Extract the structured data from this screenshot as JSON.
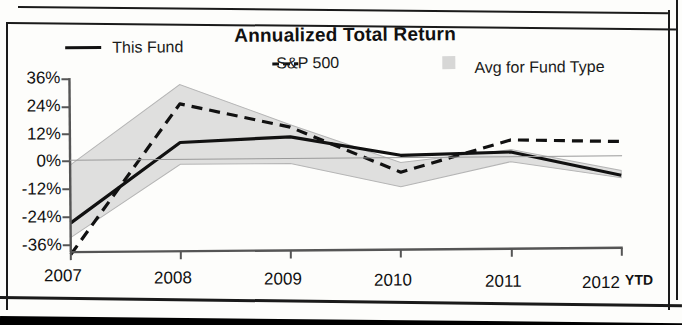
{
  "chart_data": {
    "type": "line",
    "title": "Annualized Total Return",
    "xlabel": "",
    "ylabel": "",
    "categories": [
      "2007",
      "2008",
      "2009",
      "2010",
      "2011",
      "2012 YTD"
    ],
    "x_tick_labels": [
      "2007",
      "2008",
      "2009",
      "2010",
      "2011",
      "2012"
    ],
    "x_axis_suffix": "YTD",
    "y_tick_labels": [
      "36%",
      "24%",
      "12%",
      "0%",
      "-12%",
      "-24%",
      "-36%"
    ],
    "y_tick_values": [
      36,
      24,
      12,
      0,
      -12,
      -24,
      -36
    ],
    "ylim": [
      -36,
      36
    ],
    "grid": false,
    "legend_position": "top",
    "series": [
      {
        "name": "This Fund",
        "style": "solid",
        "color": "#111111",
        "values": [
          -24,
          9,
          11,
          3,
          4,
          -6
        ]
      },
      {
        "name": "S&P 500",
        "style": "dashed",
        "color": "#111111",
        "values": [
          -37,
          25,
          15,
          -4,
          9,
          8
        ]
      },
      {
        "name": "Avg for Fund Type",
        "style": "band",
        "color": "#c9c9c9",
        "values": [
          -30,
          33,
          16,
          -10,
          5,
          -7
        ],
        "band_upper": [
          0,
          33,
          16,
          0,
          5,
          -4
        ],
        "band_lower": [
          -30,
          0,
          0,
          -10,
          0,
          -7
        ]
      }
    ]
  },
  "legend": {
    "items": [
      {
        "label": "This Fund",
        "marker": "solid-line-swatch"
      },
      {
        "label": "S&P 500",
        "marker": "dashed-line-swatch"
      },
      {
        "label": "Avg for Fund Type",
        "marker": "gray-band-swatch"
      }
    ]
  }
}
